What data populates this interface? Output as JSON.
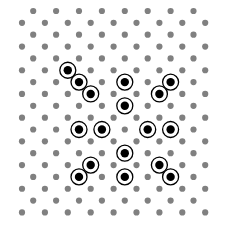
{
  "diagram": {
    "type": "dot-lattice",
    "rows": 18,
    "long_row_count": 9,
    "short_row_count": 8,
    "first_row": "short",
    "colors": {
      "background": "#ffffff",
      "grid_dot": "#808080",
      "highlight_dot": "#000000",
      "highlight_ring": "#000000"
    },
    "highlighted": [
      {
        "row": 5,
        "col": 2
      },
      {
        "row": 6,
        "col": 2
      },
      {
        "row": 6,
        "col": 4
      },
      {
        "row": 6,
        "col": 6
      },
      {
        "row": 7,
        "col": 3
      },
      {
        "row": 7,
        "col": 6
      },
      {
        "row": 8,
        "col": 4
      },
      {
        "row": 10,
        "col": 2
      },
      {
        "row": 10,
        "col": 3
      },
      {
        "row": 10,
        "col": 5
      },
      {
        "row": 10,
        "col": 6
      },
      {
        "row": 12,
        "col": 4
      },
      {
        "row": 13,
        "col": 3
      },
      {
        "row": 13,
        "col": 6
      },
      {
        "row": 14,
        "col": 2
      },
      {
        "row": 14,
        "col": 4
      },
      {
        "row": 14,
        "col": 6
      }
    ]
  }
}
